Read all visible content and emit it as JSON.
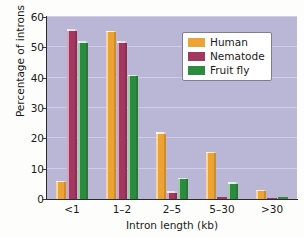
{
  "chart_data": {
    "type": "bar",
    "title": "",
    "xlabel": "Intron length (kb)",
    "ylabel": "Percentage of introns",
    "categories": [
      "<1",
      "1–2",
      "2–5",
      "5–30",
      ">30"
    ],
    "series": [
      {
        "name": "Human",
        "color": "#eca334",
        "values": [
          6,
          55.5,
          22,
          15.5,
          3
        ]
      },
      {
        "name": "Nematode",
        "color": "#a4375f",
        "values": [
          56,
          52,
          2.5,
          0.5,
          0.2
        ]
      },
      {
        "name": "Fruit fly",
        "color": "#2d8b3f",
        "values": [
          52,
          41,
          7,
          5.5,
          0.7
        ]
      }
    ],
    "ylim": [
      0,
      60
    ],
    "yticks": [
      0,
      10,
      20,
      30,
      40,
      50,
      60
    ],
    "ytick_labels": [
      "0",
      "10",
      "20",
      "30",
      "40",
      "50",
      "60"
    ],
    "grid": true,
    "legend_position": "upper right",
    "plot_background": "#b9b7d5",
    "figure_background": "#fdfdfb"
  },
  "legend": {
    "entries": [
      {
        "label": "Human"
      },
      {
        "label": "Nematode"
      },
      {
        "label": "Fruit fly"
      }
    ]
  }
}
